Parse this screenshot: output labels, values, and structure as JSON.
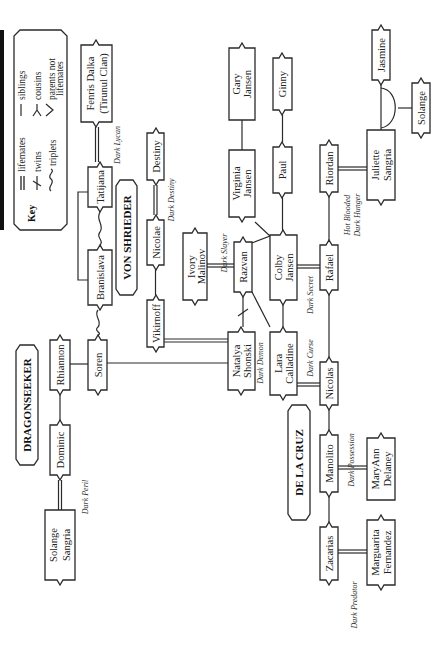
{
  "key": {
    "title": "Key",
    "items": [
      {
        "symbol": "lifemates-symbol",
        "label": "lifemates"
      },
      {
        "symbol": "twins-symbol",
        "label": "twins"
      },
      {
        "symbol": "triplets-symbol",
        "label": "triplets"
      },
      {
        "symbol": "siblings-symbol",
        "label": "siblings"
      },
      {
        "symbol": "cousins-symbol",
        "label": "cousins"
      },
      {
        "symbol": "parents-not-lifemates-symbol",
        "label": "parents not",
        "label2": "lifemates"
      }
    ]
  },
  "families": {
    "von_shrieder": "VON SHRIEDER",
    "de_la_cruz": "DE LA CRUZ",
    "dragonseeker": "DRAGONSEEKER"
  },
  "people": {
    "fenris": {
      "line1": "Fenris Dalka",
      "line2": "(Tirunul Clan)"
    },
    "tatijana": {
      "line1": "Tatijana"
    },
    "bransilava": {
      "line1": "Branislava"
    },
    "soren": {
      "line1": "Soren"
    },
    "destiny": {
      "line1": "Destiny"
    },
    "nicolae": {
      "line1": "Nicolae"
    },
    "vikirnoff": {
      "line1": "Vikirnoff"
    },
    "ivory": {
      "line1": "Ivory",
      "line2": "Malinov"
    },
    "razvan": {
      "line1": "Razvan"
    },
    "natalya": {
      "line1": "Natalya",
      "line2": "Shonski"
    },
    "virginia": {
      "line1": "Virginia",
      "line2": "Jansen"
    },
    "gary": {
      "line1": "Gary",
      "line2": "Jansen"
    },
    "paul": {
      "line1": "Paul"
    },
    "ginny": {
      "line1": "Ginny"
    },
    "colby": {
      "line1": "Colby",
      "line2": "Jansen"
    },
    "lara": {
      "line1": "Lara",
      "line2": "Calladine"
    },
    "rafael": {
      "line1": "Rafael"
    },
    "nicolas": {
      "line1": "Nicolas"
    },
    "riordan": {
      "line1": "Riordan"
    },
    "juliette": {
      "line1": "Juliette",
      "line2": "Sangria"
    },
    "jasmine": {
      "line1": "Jasmine"
    },
    "solange": {
      "line1": "Solange"
    },
    "manolito": {
      "line1": "Manolito"
    },
    "maryann": {
      "line1": "MaryAnn",
      "line2": "Delaney"
    },
    "zacarias": {
      "line1": "Zacarias"
    },
    "marguarita": {
      "line1": "Marguarita",
      "line2": "Fernandez"
    },
    "rhiannon": {
      "line1": "Rhiannon"
    },
    "dominic": {
      "line1": "Dominic"
    },
    "solange_sangria": {
      "line1": "Solange",
      "line2": "Sangria"
    }
  },
  "books": {
    "dark_lycan": "Dark Lycan",
    "dark_destiny": "Dark Destiny",
    "dark_slayer": "Dark Slayer",
    "dark_demon": "Dark Demon",
    "dark_secret": "Dark Secret",
    "dark_curse": "Dark Curse",
    "hot_blooded": "Hot Blooded",
    "dark_hunger": "Dark Hunger",
    "dark_possession": "Dark Possession",
    "dark_predator": "Dark Predator",
    "dark_peril": "Dark Peril"
  },
  "colors": {
    "ink": "#2a2a2a",
    "background": "#ffffff",
    "edge_bar": "#111111"
  }
}
